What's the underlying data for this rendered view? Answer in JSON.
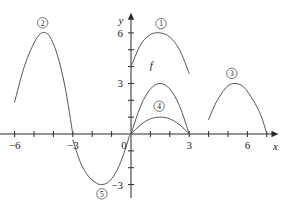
{
  "figure": {
    "name": "function-transformation-graph",
    "background_color": "#ffffff",
    "curve_color": "#555555",
    "axis_color": "#2b2b2b"
  },
  "axes": {
    "x_axis_label": "x",
    "y_axis_label": "y",
    "origin_label": "0",
    "x_ticks": [
      -7,
      -6,
      -5,
      -4,
      -3,
      -2,
      -1,
      1,
      2,
      3,
      4,
      5,
      6,
      7
    ],
    "x_tick_labels": [
      {
        "value": -6,
        "text": "−6"
      },
      {
        "value": -3,
        "text": "−3"
      },
      {
        "value": 3,
        "text": "3"
      },
      {
        "value": 6,
        "text": "6"
      }
    ],
    "y_ticks": [
      -3,
      -2,
      -1,
      1,
      2,
      3,
      4,
      5,
      6
    ],
    "y_tick_labels": [
      {
        "value": 6,
        "text": "6"
      },
      {
        "value": 3,
        "text": "3"
      },
      {
        "value": -3,
        "text": "−3"
      }
    ],
    "x_range": [
      -7.5,
      7.6
    ],
    "y_range": [
      -3.8,
      7.2
    ]
  },
  "chart_data": {
    "type": "line",
    "title": "",
    "xlabel": "x",
    "ylabel": "y",
    "xlim": [
      -7.5,
      7.6
    ],
    "ylim": [
      -3.8,
      7.2
    ],
    "grid": false,
    "legend": "inline-labels",
    "base_function": {
      "name": "f",
      "label": "f",
      "label_position": {
        "x": 1.05,
        "y": 3.85
      },
      "description": "downward parabola, roots at x=0 and x=3, vertex (1.5, 3)",
      "roots": [
        0,
        3
      ],
      "vertex": {
        "x": 1.5,
        "y": 3
      },
      "points": [
        {
          "x": 0,
          "y": 0
        },
        {
          "x": 0.5,
          "y": 1.67
        },
        {
          "x": 1.0,
          "y": 2.67
        },
        {
          "x": 1.5,
          "y": 3.0
        },
        {
          "x": 2.0,
          "y": 2.67
        },
        {
          "x": 2.5,
          "y": 1.67
        },
        {
          "x": 3.0,
          "y": 0
        }
      ]
    },
    "series": [
      {
        "name": "curve-1",
        "label": "①",
        "badge": "1",
        "label_position": {
          "x": 1.55,
          "y": 6.55
        },
        "description": "vertical shift up: f(x) + 3; roots shifted, vertex (1.5, 6)",
        "vertex": {
          "x": 1.5,
          "y": 6
        },
        "domain": [
          0,
          3
        ],
        "points": [
          {
            "x": 0,
            "y": 4.0
          },
          {
            "x": 0.5,
            "y": 5.3
          },
          {
            "x": 1.0,
            "y": 5.9
          },
          {
            "x": 1.5,
            "y": 6.0
          },
          {
            "x": 2.0,
            "y": 5.75
          },
          {
            "x": 2.5,
            "y": 5.0
          },
          {
            "x": 3.0,
            "y": 3.6
          }
        ]
      },
      {
        "name": "curve-2",
        "label": "②",
        "badge": "2",
        "label_position": {
          "x": -4.55,
          "y": 6.6
        },
        "description": "horizontal compression and shift left; peak near x=-4.5, right root at x=-3",
        "vertex": {
          "x": -4.5,
          "y": 6.0
        },
        "domain": [
          -6.0,
          -3.0
        ],
        "points": [
          {
            "x": -6.0,
            "y": 1.9
          },
          {
            "x": -5.5,
            "y": 4.0
          },
          {
            "x": -5.0,
            "y": 5.4
          },
          {
            "x": -4.6,
            "y": 6.0
          },
          {
            "x": -4.2,
            "y": 5.8
          },
          {
            "x": -3.8,
            "y": 4.7
          },
          {
            "x": -3.4,
            "y": 2.8
          },
          {
            "x": -3.0,
            "y": 0.0
          }
        ]
      },
      {
        "name": "curve-3",
        "label": "③",
        "badge": "3",
        "label_position": {
          "x": 5.2,
          "y": 3.6
        },
        "description": "horizontal shift right; roots near x=4 and x=7, vertex (5.3, 3)",
        "vertex": {
          "x": 5.3,
          "y": 3.0
        },
        "domain": [
          4.0,
          7.0
        ],
        "points": [
          {
            "x": 4.0,
            "y": 0.85
          },
          {
            "x": 4.4,
            "y": 1.9
          },
          {
            "x": 4.9,
            "y": 2.75
          },
          {
            "x": 5.3,
            "y": 3.0
          },
          {
            "x": 5.8,
            "y": 2.8
          },
          {
            "x": 6.3,
            "y": 2.0
          },
          {
            "x": 6.7,
            "y": 1.1
          },
          {
            "x": 7.0,
            "y": 0.0
          }
        ]
      },
      {
        "name": "curve-4",
        "label": "④",
        "badge": "4",
        "label_position": {
          "x": 1.45,
          "y": 1.65
        },
        "description": "vertical compression of f; roots at x=0 and x=3, vertex (1.5, 1)",
        "vertex": {
          "x": 1.5,
          "y": 1.0
        },
        "domain": [
          0,
          3
        ],
        "points": [
          {
            "x": 0,
            "y": 0
          },
          {
            "x": 0.5,
            "y": 0.55
          },
          {
            "x": 1.0,
            "y": 0.9
          },
          {
            "x": 1.5,
            "y": 1.0
          },
          {
            "x": 2.0,
            "y": 0.9
          },
          {
            "x": 2.5,
            "y": 0.55
          },
          {
            "x": 3.0,
            "y": 0
          }
        ]
      },
      {
        "name": "curve-5",
        "label": "⑤",
        "badge": "5",
        "label_position": {
          "x": -1.5,
          "y": -3.55
        },
        "description": "reflection and shift left; upward parabola, roots at x=-3 and x=0, vertex (-1.5, -3)",
        "vertex": {
          "x": -1.5,
          "y": -3.0
        },
        "domain": [
          -3.0,
          0
        ],
        "points": [
          {
            "x": -3.0,
            "y": -0.35
          },
          {
            "x": -2.6,
            "y": -1.7
          },
          {
            "x": -2.2,
            "y": -2.5
          },
          {
            "x": -1.8,
            "y": -2.9
          },
          {
            "x": -1.5,
            "y": -3.0
          },
          {
            "x": -1.1,
            "y": -2.8
          },
          {
            "x": -0.7,
            "y": -2.1
          },
          {
            "x": -0.35,
            "y": -1.1
          },
          {
            "x": -0.08,
            "y": -0.1
          }
        ]
      }
    ]
  }
}
